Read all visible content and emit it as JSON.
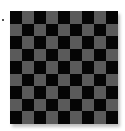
{
  "board": {
    "rows": 9,
    "cols": 9,
    "colors": {
      "dark": "#050505",
      "light": "#5a5a5a"
    },
    "top_left": "dark"
  },
  "marker": {
    "color": "#555555"
  }
}
